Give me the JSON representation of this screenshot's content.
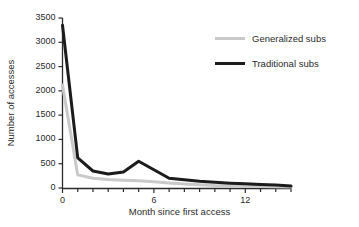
{
  "chart_data": {
    "type": "line",
    "title": "",
    "subtitle": "",
    "xlabel": "Month since first access",
    "ylabel": "Number of accesses",
    "xlim": [
      0,
      15
    ],
    "ylim": [
      0,
      3500
    ],
    "grid": false,
    "legend_position": "top-right",
    "x_ticks_major": [
      0,
      6,
      12
    ],
    "x_tick_labels": [
      "0",
      "6",
      "12"
    ],
    "x_ticks_minor": [
      1,
      2,
      3,
      4,
      5,
      7,
      8,
      9,
      10,
      11,
      13,
      14,
      15
    ],
    "y_ticks": [
      0,
      500,
      1000,
      1500,
      2000,
      2500,
      3000,
      3500
    ],
    "y_tick_labels": [
      "0",
      "500",
      "1000",
      "1500",
      "2000",
      "2500",
      "3000",
      "3500"
    ],
    "x": [
      0,
      1,
      2,
      3,
      4,
      5,
      6,
      7,
      8,
      9,
      10,
      11,
      12,
      13,
      14,
      15
    ],
    "series": [
      {
        "name": "Generalized subs",
        "color": "#c9c9c9",
        "width": 3.0,
        "values": [
          2120,
          270,
          200,
          175,
          160,
          150,
          130,
          105,
          80,
          65,
          50,
          42,
          35,
          30,
          25,
          20
        ]
      },
      {
        "name": "Traditional subs",
        "color": "#1c1c1c",
        "width": 3.0,
        "values": [
          3350,
          620,
          350,
          290,
          330,
          550,
          375,
          200,
          170,
          140,
          120,
          100,
          85,
          70,
          60,
          40
        ]
      }
    ]
  },
  "axes": {
    "y_title": "Number of accesses",
    "x_title": "Month since first access",
    "axis_color": "#2b2b2b"
  },
  "legend": {
    "items": [
      {
        "label": "Generalized subs",
        "color": "#c9c9c9"
      },
      {
        "label": "Traditional subs",
        "color": "#1c1c1c"
      }
    ]
  },
  "ticks": {
    "y": [
      "3500",
      "3000",
      "2500",
      "2000",
      "1500",
      "1000",
      "500",
      "0"
    ],
    "x": [
      "0",
      "6",
      "12"
    ]
  }
}
